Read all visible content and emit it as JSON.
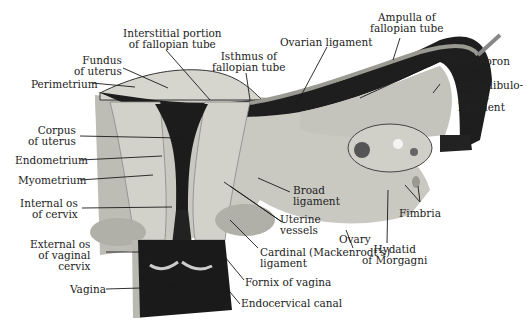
{
  "figure": {
    "colors": {
      "background": "#ffffff",
      "tissue_light": "#d9d9d3",
      "tissue_mid": "#b8b8b0",
      "tissue_dark": "#7a7a74",
      "cavity": "#1c1c1c",
      "leader_line": "#1a1a1a"
    }
  },
  "labels": {
    "interstitial": "Interstitial portion\nof fallopian tube",
    "fundus": "Fundus\nof uterus",
    "perimetrium": "Perimetrium",
    "isthmus": "Isthmus of\nfallopian tube",
    "ovarian_ligament": "Ovarian ligament",
    "ampulla": "Ampulla of\nfallopian tube",
    "epoophoron": "Epoophoron",
    "infundibulo": "Infundibulo-\npelvic\nligament",
    "corpus": "Corpus\nof uterus",
    "endometrium": "Endometrium",
    "myometrium": "Myometrium",
    "internal_os": "Internal os\nof cervix",
    "external_os": "External os\nof vaginal\ncervix",
    "vagina": "Vagina",
    "broad_ligament": "Broad\nligament",
    "uterine_vessels": "Uterine\nvessels",
    "cardinal": "Cardinal (Mackenrodt's)\nligament",
    "fornix": "Fornix of vagina",
    "endocervical": "Endocervical canal",
    "ovary": "Ovary",
    "hydatid": "Hydatid\nof Morgagni",
    "fimbria": "Fimbria"
  }
}
